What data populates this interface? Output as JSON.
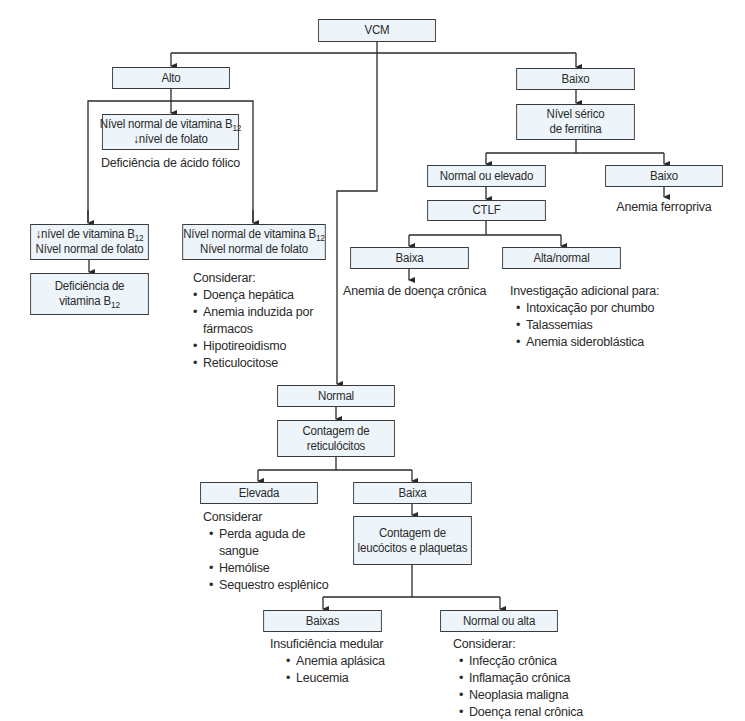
{
  "diagram": {
    "nodes": {
      "vcm": "VCM",
      "alto": "Alto",
      "baixo_top": "Baixo",
      "b12_normal_folato_baixo": {
        "line1": "Nível normal de vitamina B",
        "sub1": "12",
        "line2": "↓nível de folato"
      },
      "b12_baixo_folato_normal": {
        "line1": "↓nível de vitamina B",
        "sub1": "12",
        "line2": "Nível normal de folato"
      },
      "b12_normal_folato_normal": {
        "line1": "Nível normal de vitamina B",
        "sub1": "12",
        "line2": "Nível normal de folato"
      },
      "deficiencia_b12": {
        "line1": "Deficiência de",
        "line2": "vitamina B",
        "sub2": "12"
      },
      "ferritina": {
        "line1": "Nível sérico",
        "line2": "de ferritina"
      },
      "normal_ou_elevado": "Normal ou elevado",
      "baixo_ferritina": "Baixo",
      "ctlf": "CTLF",
      "baixa_ctlf": "Baixa",
      "alta_normal": "Alta/normal",
      "normal": "Normal",
      "contagem_reticulocitos": {
        "line1": "Contagem de",
        "line2": "reticulócitos"
      },
      "elevada": "Elevada",
      "baixa_retic": "Baixa",
      "contagem_leucocitos": {
        "line1": "Contagem de",
        "line2": "leucócitos e plaquetas"
      },
      "baixas": "Baixas",
      "normal_ou_alta": "Normal ou alta"
    },
    "notes": {
      "deficiencia_acido_folico": "Deficiência de ácido fólico",
      "anemia_ferropriva": "Anemia ferropriva",
      "anemia_doenca_cronica": "Anemia de doença crônica",
      "considerar_normal_normal": {
        "title": "Considerar:",
        "items": [
          "Doença hepática",
          "Anemia induzida por",
          "fármacos",
          "Hipotireoidismo",
          "Reticulocitose"
        ]
      },
      "investigacao_adicional": {
        "title": "Investigação adicional para:",
        "items": [
          "Intoxicação por chumbo",
          "Talassemias",
          "Anemia sideroblástica"
        ]
      },
      "considerar_elevada": {
        "title": "Considerar",
        "items": [
          "Perda aguda de",
          "sangue",
          "Hemólise",
          "Sequestro esplênico"
        ]
      },
      "insuficiencia_medular": {
        "title": "Insuficiência medular",
        "items": [
          "Anemia aplásica",
          "Leucemia"
        ]
      },
      "considerar_normal_alta": {
        "title": "Considerar:",
        "items": [
          "Infecção crônica",
          "Inflamação crônica",
          "Neoplasia maligna",
          "Doença renal crônica"
        ]
      }
    }
  }
}
